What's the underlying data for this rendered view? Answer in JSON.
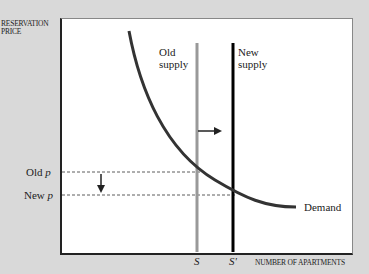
{
  "axes": {
    "y_label_line1": "RESERVATION",
    "y_label_line2": "PRICE",
    "x_label": "NUMBER OF APARTMENTS"
  },
  "curves": {
    "old_supply_line1": "Old",
    "old_supply_line2": "supply",
    "new_supply_line1": "New",
    "new_supply_line2": "supply",
    "demand": "Demand"
  },
  "prices": {
    "old_p_text": "Old ",
    "old_p_var": "p",
    "new_p_text": "New ",
    "new_p_var": "p"
  },
  "quantities": {
    "s": "S",
    "s_prime": "S'"
  },
  "colors": {
    "background": "#d9d9d9",
    "plot": "#ffffff",
    "old_supply": "#999999",
    "new_supply": "#000000",
    "demand": "#333333"
  }
}
